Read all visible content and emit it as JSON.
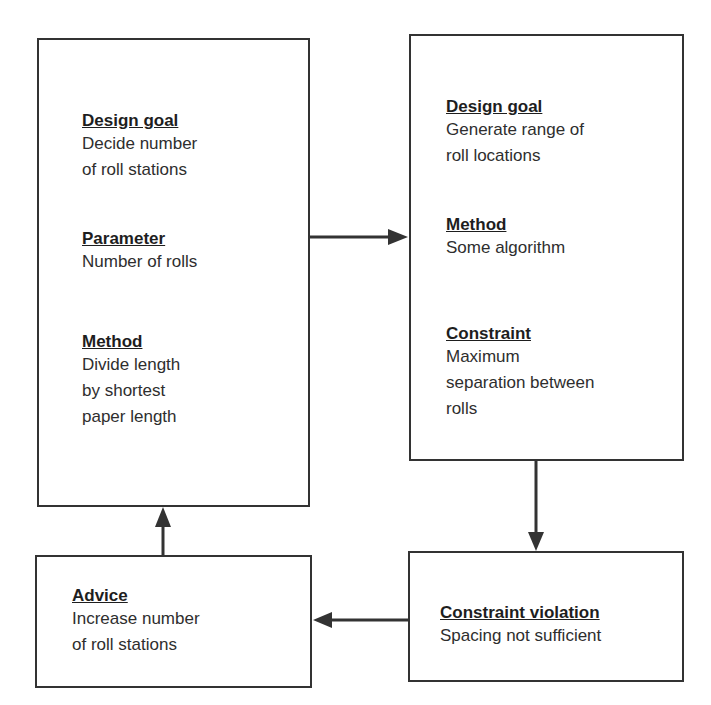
{
  "boxes": {
    "roll_stations": {
      "sections": [
        {
          "heading": "Design goal",
          "text": "Decide number\nof roll stations"
        },
        {
          "heading": "Parameter",
          "text": "Number of rolls"
        },
        {
          "heading": "Method",
          "text": "Divide length\nby shortest\npaper length"
        }
      ]
    },
    "roll_locations": {
      "sections": [
        {
          "heading": "Design goal",
          "text": "Generate range of\nroll locations"
        },
        {
          "heading": "Method",
          "text": "Some algorithm"
        },
        {
          "heading": "Constraint",
          "text": "Maximum\nseparation between\nrolls"
        }
      ]
    },
    "violation": {
      "sections": [
        {
          "heading": "Constraint violation",
          "text": "Spacing not sufficient"
        }
      ]
    },
    "advice": {
      "sections": [
        {
          "heading": "Advice",
          "text": "Increase number\nof roll stations"
        }
      ]
    }
  },
  "colors": {
    "line": "#333333",
    "text": "#2a2a2a",
    "background": "#ffffff"
  }
}
